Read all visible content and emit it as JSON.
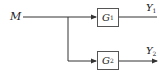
{
  "diagram": {
    "type": "block-diagram",
    "input": {
      "label": "M"
    },
    "blocks": [
      {
        "id": "G1",
        "label": "G",
        "subscript": "1"
      },
      {
        "id": "G2",
        "label": "G",
        "subscript": "2"
      }
    ],
    "outputs": [
      {
        "label": "Y",
        "subscript": "1"
      },
      {
        "label": "Y",
        "subscript": "2"
      }
    ],
    "colors": {
      "line": "#333333",
      "box_border": "#555555",
      "text": "#222222"
    }
  }
}
